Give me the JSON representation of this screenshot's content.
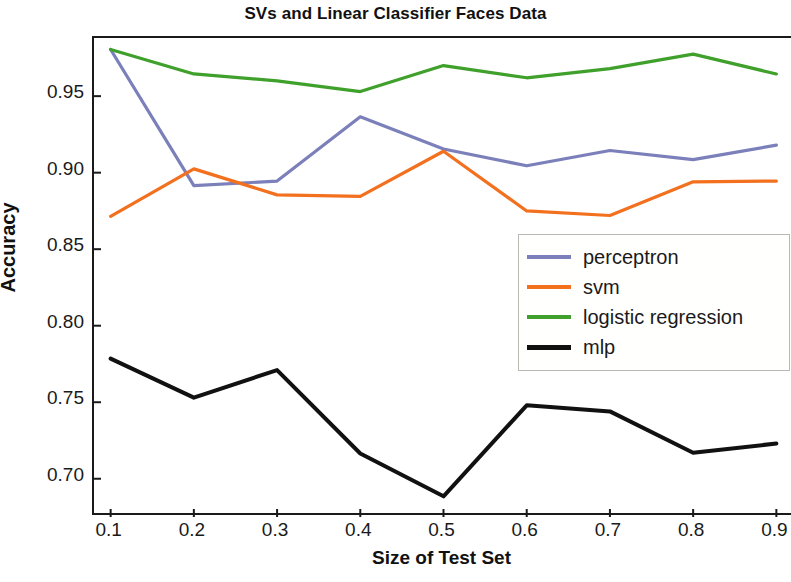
{
  "chart_data": {
    "type": "line",
    "title": "SVs and Linear Classifier Faces Data",
    "xlabel": "Size of Test Set",
    "ylabel": "Accuracy",
    "x": [
      0.1,
      0.2,
      0.3,
      0.4,
      0.5,
      0.6,
      0.7,
      0.8,
      0.9
    ],
    "xlim": [
      0.08,
      0.92
    ],
    "ylim": [
      0.675,
      0.988
    ],
    "xticks": [
      "0.1",
      "0.2",
      "0.3",
      "0.4",
      "0.5",
      "0.6",
      "0.7",
      "0.8",
      "0.9"
    ],
    "yticks": [
      "0.70",
      "0.75",
      "0.80",
      "0.85",
      "0.90",
      "0.95"
    ],
    "grid": false,
    "legend_position": "center right",
    "series": [
      {
        "name": "perceptron",
        "color": "#7b7fba",
        "values": [
          0.9805,
          0.8915,
          0.8945,
          0.9365,
          0.9155,
          0.9045,
          0.9145,
          0.9085,
          0.918
        ]
      },
      {
        "name": "svm",
        "color": "#f2701e",
        "values": [
          0.8715,
          0.9025,
          0.8855,
          0.8845,
          0.914,
          0.875,
          0.872,
          0.894,
          0.8945
        ]
      },
      {
        "name": "logistic regression",
        "color": "#3fa02c",
        "values": [
          0.9805,
          0.9645,
          0.96,
          0.953,
          0.97,
          0.962,
          0.968,
          0.9775,
          0.9645
        ]
      },
      {
        "name": "mlp",
        "color": "#111111",
        "values": [
          0.7785,
          0.753,
          0.771,
          0.7165,
          0.6885,
          0.748,
          0.744,
          0.717,
          0.723
        ]
      }
    ]
  },
  "legend": {
    "items": [
      {
        "label": "perceptron",
        "color": "#7b7fba"
      },
      {
        "label": "svm",
        "color": "#f2701e"
      },
      {
        "label": "logistic regression",
        "color": "#3fa02c"
      },
      {
        "label": "mlp",
        "color": "#111111"
      }
    ]
  }
}
